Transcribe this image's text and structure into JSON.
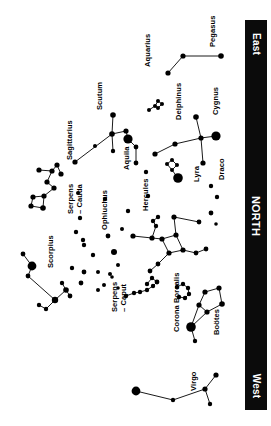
{
  "chart": {
    "background_color": "#ffffff",
    "star_color": "#000000",
    "line_color": "#000000",
    "horizon_bar_color": "#0b0b0b",
    "horizon_text_color": "#ffffff",
    "orientation_note": "labels rotated 90 degrees; horizon bar along right edge"
  },
  "horizon": {
    "east_label": "East",
    "north_label": "NORTH",
    "west_label": "West"
  },
  "chart_data": {
    "type": "scatter",
    "xlabel": "",
    "ylabel": "",
    "xlim": [
      0,
      271
    ],
    "ylim": [
      0,
      426
    ],
    "grid": false,
    "legend": "none",
    "annotations": [
      "East",
      "NORTH",
      "West"
    ],
    "constellations": [
      {
        "name": "Pegasus",
        "label_x": 209,
        "label_y": 47,
        "stars": [
          {
            "x": 168,
            "y": 73,
            "r": 2.6
          },
          {
            "x": 183,
            "y": 56,
            "r": 2.6
          },
          {
            "x": 221,
            "y": 56,
            "r": 2.8
          }
        ],
        "lines": [
          [
            0,
            1
          ],
          [
            1,
            2
          ]
        ]
      },
      {
        "name": "Aquarius",
        "label_x": 144,
        "label_y": 67,
        "stars": [],
        "lines": []
      },
      {
        "name": "Scutum",
        "label_x": 96,
        "label_y": 110,
        "stars": [],
        "lines": []
      },
      {
        "name": "Aquila",
        "label_x": 123,
        "label_y": 170,
        "stars": [
          {
            "x": 75,
            "y": 162,
            "r": 2.6
          },
          {
            "x": 113,
            "y": 115,
            "r": 2.8
          },
          {
            "x": 112,
            "y": 134,
            "r": 2.8
          },
          {
            "x": 126,
            "y": 131,
            "r": 2.6
          },
          {
            "x": 128,
            "y": 139,
            "r": 4.6
          },
          {
            "x": 113,
            "y": 151,
            "r": 2.2
          },
          {
            "x": 136,
            "y": 147,
            "r": 2.4
          },
          {
            "x": 136,
            "y": 163,
            "r": 2.4
          }
        ],
        "lines": [
          [
            0,
            2
          ],
          [
            1,
            2
          ],
          [
            2,
            3
          ],
          [
            3,
            4
          ],
          [
            2,
            5
          ],
          [
            4,
            6
          ],
          [
            6,
            7
          ]
        ]
      },
      {
        "name": "Delphinus",
        "label_x": 175,
        "label_y": 120,
        "stars": [
          {
            "x": 149,
            "y": 110,
            "r": 2.0
          },
          {
            "x": 155,
            "y": 106,
            "r": 2.0
          },
          {
            "x": 158,
            "y": 101,
            "r": 2.0
          },
          {
            "x": 162,
            "y": 104,
            "r": 2.0
          },
          {
            "x": 158,
            "y": 108,
            "r": 2.0
          }
        ],
        "lines": [
          [
            0,
            1
          ],
          [
            1,
            2
          ],
          [
            2,
            3
          ],
          [
            3,
            4
          ],
          [
            4,
            1
          ]
        ]
      },
      {
        "name": "Cygnus",
        "label_x": 212,
        "label_y": 115,
        "stars": [
          {
            "x": 196,
            "y": 117,
            "r": 2.8
          },
          {
            "x": 201,
            "y": 138,
            "r": 2.6
          },
          {
            "x": 216,
            "y": 136,
            "r": 4.6
          },
          {
            "x": 175,
            "y": 144,
            "r": 2.6
          },
          {
            "x": 155,
            "y": 154,
            "r": 2.6
          },
          {
            "x": 203,
            "y": 163,
            "r": 2.6
          }
        ],
        "lines": [
          [
            0,
            1
          ],
          [
            1,
            2
          ],
          [
            1,
            3
          ],
          [
            3,
            4
          ],
          [
            1,
            5
          ]
        ]
      },
      {
        "name": "Lyra",
        "label_x": 193,
        "label_y": 182,
        "stars": [
          {
            "x": 167,
            "y": 164,
            "r": 2.0
          },
          {
            "x": 172,
            "y": 160,
            "r": 2.0
          },
          {
            "x": 177,
            "y": 165,
            "r": 2.0
          },
          {
            "x": 172,
            "y": 170,
            "r": 2.0
          },
          {
            "x": 178,
            "y": 178,
            "r": 4.8
          }
        ],
        "lines": [
          [
            0,
            1
          ],
          [
            1,
            2
          ],
          [
            2,
            3
          ],
          [
            3,
            0
          ],
          [
            3,
            4
          ]
        ]
      },
      {
        "name": "Draco",
        "label_x": 218,
        "label_y": 180,
        "stars": [
          {
            "x": 211,
            "y": 186,
            "r": 2.2
          },
          {
            "x": 217,
            "y": 197,
            "r": 2.2
          }
        ],
        "lines": []
      },
      {
        "name": "Sagittarius",
        "label_x": 66,
        "label_y": 160,
        "stars": [
          {
            "x": 39,
            "y": 170,
            "r": 2.6
          },
          {
            "x": 52,
            "y": 171,
            "r": 2.6
          },
          {
            "x": 57,
            "y": 165,
            "r": 2.6
          },
          {
            "x": 61,
            "y": 174,
            "r": 2.6
          },
          {
            "x": 47,
            "y": 182,
            "r": 2.6
          },
          {
            "x": 54,
            "y": 188,
            "r": 2.6
          },
          {
            "x": 44,
            "y": 196,
            "r": 2.6
          },
          {
            "x": 33,
            "y": 197,
            "r": 2.6
          },
          {
            "x": 31,
            "y": 206,
            "r": 2.6
          },
          {
            "x": 43,
            "y": 208,
            "r": 2.8
          }
        ],
        "lines": [
          [
            0,
            1
          ],
          [
            1,
            2
          ],
          [
            2,
            3
          ],
          [
            1,
            4
          ],
          [
            4,
            5
          ],
          [
            5,
            6
          ],
          [
            6,
            7
          ],
          [
            7,
            8
          ],
          [
            8,
            9
          ],
          [
            9,
            6
          ]
        ]
      },
      {
        "name": "Serpens\n– Cauda",
        "label_x": 67,
        "label_y": 214,
        "stars": [
          {
            "x": 80,
            "y": 218,
            "r": 2.2
          },
          {
            "x": 76,
            "y": 232,
            "r": 2.2
          },
          {
            "x": 83,
            "y": 240,
            "r": 2.2
          }
        ],
        "lines": []
      },
      {
        "name": "Ophiuchus",
        "label_x": 101,
        "label_y": 230,
        "stars": [
          {
            "x": 84,
            "y": 245,
            "r": 2.2
          },
          {
            "x": 93,
            "y": 255,
            "r": 2.2
          },
          {
            "x": 98,
            "y": 272,
            "r": 2.0
          },
          {
            "x": 72,
            "y": 268,
            "r": 2.2
          },
          {
            "x": 81,
            "y": 283,
            "r": 2.4
          },
          {
            "x": 108,
            "y": 236,
            "r": 2.4
          },
          {
            "x": 114,
            "y": 252,
            "r": 3.0
          }
        ],
        "lines": []
      },
      {
        "name": "Scorpius",
        "label_x": 47,
        "label_y": 268,
        "stars": [
          {
            "x": 23,
            "y": 254,
            "r": 2.4
          },
          {
            "x": 32,
            "y": 266,
            "r": 4.4
          },
          {
            "x": 28,
            "y": 276,
            "r": 2.4
          },
          {
            "x": 55,
            "y": 300,
            "r": 3.2
          },
          {
            "x": 66,
            "y": 290,
            "r": 2.8
          },
          {
            "x": 70,
            "y": 296,
            "r": 2.4
          },
          {
            "x": 62,
            "y": 283,
            "r": 2.2
          },
          {
            "x": 46,
            "y": 309,
            "r": 2.2
          },
          {
            "x": 39,
            "y": 305,
            "r": 2.2
          }
        ],
        "lines": [
          [
            0,
            1
          ],
          [
            1,
            2
          ],
          [
            2,
            3
          ],
          [
            3,
            4
          ],
          [
            4,
            5
          ],
          [
            4,
            6
          ],
          [
            3,
            7
          ],
          [
            7,
            8
          ]
        ]
      },
      {
        "name": "Hercules",
        "label_x": 142,
        "label_y": 211,
        "stars": [
          {
            "x": 174,
            "y": 217,
            "r": 2.6
          },
          {
            "x": 199,
            "y": 222,
            "r": 2.4
          },
          {
            "x": 176,
            "y": 235,
            "r": 2.6
          },
          {
            "x": 183,
            "y": 250,
            "r": 2.6
          },
          {
            "x": 169,
            "y": 253,
            "r": 2.6
          },
          {
            "x": 162,
            "y": 239,
            "r": 2.6
          },
          {
            "x": 152,
            "y": 238,
            "r": 2.6
          },
          {
            "x": 133,
            "y": 236,
            "r": 2.6
          },
          {
            "x": 156,
            "y": 226,
            "r": 2.2
          },
          {
            "x": 153,
            "y": 221,
            "r": 2.2
          },
          {
            "x": 158,
            "y": 217,
            "r": 2.2
          },
          {
            "x": 196,
            "y": 253,
            "r": 2.4
          },
          {
            "x": 206,
            "y": 249,
            "r": 2.4
          },
          {
            "x": 158,
            "y": 264,
            "r": 2.4
          },
          {
            "x": 150,
            "y": 271,
            "r": 2.4
          }
        ],
        "lines": [
          [
            0,
            1
          ],
          [
            0,
            2
          ],
          [
            2,
            3
          ],
          [
            3,
            4
          ],
          [
            4,
            5
          ],
          [
            5,
            2
          ],
          [
            5,
            6
          ],
          [
            6,
            7
          ],
          [
            6,
            8
          ],
          [
            8,
            9
          ],
          [
            9,
            10
          ],
          [
            3,
            11
          ],
          [
            11,
            12
          ],
          [
            4,
            13
          ],
          [
            13,
            14
          ]
        ]
      },
      {
        "name": "Serpens\n– Caput",
        "label_x": 111,
        "label_y": 312,
        "stars": [
          {
            "x": 126,
            "y": 296,
            "r": 2.2
          },
          {
            "x": 134,
            "y": 293,
            "r": 2.2
          },
          {
            "x": 140,
            "y": 292,
            "r": 2.2
          },
          {
            "x": 147,
            "y": 290,
            "r": 2.2
          },
          {
            "x": 153,
            "y": 286,
            "r": 2.2
          },
          {
            "x": 157,
            "y": 282,
            "r": 2.4
          },
          {
            "x": 152,
            "y": 278,
            "r": 2.2
          },
          {
            "x": 147,
            "y": 284,
            "r": 2.2
          }
        ],
        "lines": [
          [
            0,
            1
          ],
          [
            1,
            2
          ],
          [
            2,
            3
          ],
          [
            3,
            4
          ],
          [
            4,
            5
          ],
          [
            5,
            6
          ],
          [
            6,
            7
          ]
        ]
      },
      {
        "name": "Corona Borealis",
        "label_x": 173,
        "label_y": 332,
        "stars": [
          {
            "x": 177,
            "y": 287,
            "r": 2.2
          },
          {
            "x": 183,
            "y": 284,
            "r": 2.2
          },
          {
            "x": 188,
            "y": 288,
            "r": 2.2
          },
          {
            "x": 189,
            "y": 294,
            "r": 2.2
          },
          {
            "x": 185,
            "y": 298,
            "r": 2.2
          },
          {
            "x": 179,
            "y": 297,
            "r": 2.2
          }
        ],
        "lines": [
          [
            0,
            1
          ],
          [
            1,
            2
          ],
          [
            2,
            3
          ],
          [
            3,
            4
          ],
          [
            4,
            5
          ]
        ]
      },
      {
        "name": "Boötes",
        "label_x": 213,
        "label_y": 335,
        "stars": [
          {
            "x": 205,
            "y": 292,
            "r": 2.6
          },
          {
            "x": 219,
            "y": 288,
            "r": 2.6
          },
          {
            "x": 222,
            "y": 304,
            "r": 2.8
          },
          {
            "x": 207,
            "y": 312,
            "r": 2.6
          },
          {
            "x": 199,
            "y": 305,
            "r": 2.6
          },
          {
            "x": 191,
            "y": 327,
            "r": 4.8
          },
          {
            "x": 195,
            "y": 341,
            "r": 2.2
          }
        ],
        "lines": [
          [
            0,
            1
          ],
          [
            1,
            2
          ],
          [
            2,
            3
          ],
          [
            3,
            4
          ],
          [
            4,
            0
          ],
          [
            4,
            5
          ],
          [
            3,
            5
          ],
          [
            5,
            6
          ]
        ]
      },
      {
        "name": "Virgo",
        "label_x": 190,
        "label_y": 391,
        "stars": [
          {
            "x": 136,
            "y": 391,
            "r": 4.4
          },
          {
            "x": 173,
            "y": 400,
            "r": 2.2
          },
          {
            "x": 205,
            "y": 389,
            "r": 2.6
          },
          {
            "x": 216,
            "y": 375,
            "r": 2.6
          },
          {
            "x": 210,
            "y": 404,
            "r": 2.2
          }
        ],
        "lines": [
          [
            0,
            1
          ],
          [
            1,
            2
          ],
          [
            2,
            3
          ],
          [
            2,
            4
          ]
        ]
      }
    ],
    "field_stars": [
      {
        "x": 148,
        "y": 196,
        "r": 2.2
      },
      {
        "x": 128,
        "y": 211,
        "r": 2.2
      },
      {
        "x": 122,
        "y": 229,
        "r": 2.0
      },
      {
        "x": 105,
        "y": 199,
        "r": 2.2
      },
      {
        "x": 118,
        "y": 265,
        "r": 2.0
      },
      {
        "x": 110,
        "y": 274,
        "r": 2.0
      },
      {
        "x": 112,
        "y": 277,
        "r": 1.8
      },
      {
        "x": 84,
        "y": 272,
        "r": 2.4
      },
      {
        "x": 98,
        "y": 290,
        "r": 2.0
      },
      {
        "x": 104,
        "y": 285,
        "r": 2.0
      },
      {
        "x": 118,
        "y": 288,
        "r": 1.8
      },
      {
        "x": 146,
        "y": 172,
        "r": 2.2
      },
      {
        "x": 211,
        "y": 213,
        "r": 2.4
      },
      {
        "x": 216,
        "y": 224,
        "r": 1.8
      },
      {
        "x": 95,
        "y": 146,
        "r": 2.0
      },
      {
        "x": 78,
        "y": 193,
        "r": 2.0
      }
    ]
  }
}
